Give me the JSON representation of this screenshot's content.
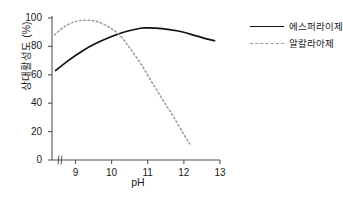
{
  "chart_data": {
    "type": "line",
    "title": "",
    "xlabel": "pH",
    "ylabel": "상대활성도 (%)",
    "xlim": [
      8.35,
      13.0
    ],
    "ylim": [
      0,
      100
    ],
    "xticks": [
      "9",
      "10",
      "11",
      "12",
      "13"
    ],
    "xtick_values": [
      9,
      10,
      11,
      12,
      13
    ],
    "yticks": [
      "0",
      "20",
      "40",
      "60",
      "80",
      "100"
    ],
    "ytick_values": [
      0,
      20,
      40,
      60,
      80,
      100
    ],
    "grid": false,
    "axis_break": true,
    "axis_break_symbol": "∫",
    "legend_position": "right",
    "series": [
      {
        "name": "에스퍼라이제",
        "style": "solid",
        "color": "#111111",
        "x": [
          8.45,
          8.8,
          9.2,
          9.6,
          10.0,
          10.4,
          10.8,
          11.0,
          11.4,
          11.8,
          12.2,
          12.6,
          12.85
        ],
        "values": [
          63,
          70,
          77,
          82.5,
          87,
          90.5,
          92.8,
          93,
          92.5,
          91,
          88.5,
          85.5,
          84
        ]
      },
      {
        "name": "알칼라아제",
        "style": "dashed",
        "color": "#9a9a9a",
        "x": [
          8.42,
          8.7,
          9.0,
          9.3,
          9.6,
          9.9,
          10.2,
          10.5,
          10.8,
          11.1,
          11.4,
          11.7,
          12.0,
          12.2
        ],
        "values": [
          88,
          94,
          97.5,
          98.5,
          97.5,
          94,
          88.5,
          79,
          68,
          55.5,
          43,
          31,
          18,
          10
        ]
      }
    ]
  },
  "legend": {
    "items": [
      {
        "label": "에스퍼라이제",
        "style": "solid"
      },
      {
        "label": "알칼라아제",
        "style": "dashed"
      }
    ]
  }
}
